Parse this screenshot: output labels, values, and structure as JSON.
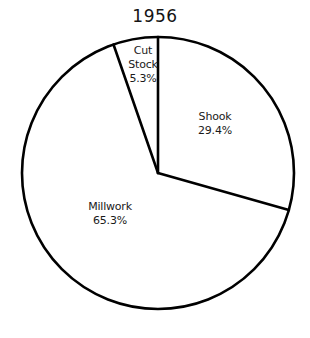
{
  "chart_data": {
    "type": "pie",
    "title": "1956",
    "xlabel": "",
    "ylabel": "",
    "legend": "none",
    "grid": false,
    "start_angle_deg": 0,
    "direction": "clockwise",
    "categories": [
      "Shook",
      "Millwork",
      "Cut Stock"
    ],
    "values": [
      29.4,
      65.3,
      5.3
    ],
    "units": "percent",
    "slices": [
      {
        "name": "Shook",
        "value": 29.4,
        "value_label": "29.4%",
        "start_deg": 0,
        "end_deg": 105.8,
        "fill": "#ffffff",
        "stroke": "#000000"
      },
      {
        "name": "Millwork",
        "value": 65.3,
        "value_label": "65.3%",
        "start_deg": 105.8,
        "end_deg": 340.9,
        "fill": "#ffffff",
        "stroke": "#000000"
      },
      {
        "name": "Cut Stock",
        "value": 5.3,
        "value_label": "5.3%",
        "start_deg": 340.9,
        "end_deg": 360,
        "fill": "#ffffff",
        "stroke": "#000000"
      }
    ]
  },
  "labels": {
    "cut_stock": {
      "line1": "Cut",
      "line2": "Stock",
      "value": "5.3%"
    },
    "shook": {
      "name": "Shook",
      "value": "29.4%"
    },
    "millwork": {
      "name": "Millwork",
      "value": "65.3%"
    }
  },
  "colors": {
    "background": "#ffffff",
    "outline": "#000000",
    "text": "#141414"
  },
  "geometry": {
    "center_x": 158,
    "center_y": 173,
    "radius": 136
  }
}
